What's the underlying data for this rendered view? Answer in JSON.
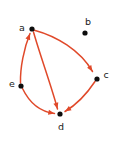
{
  "figure": {
    "background_color": "#ffffff",
    "width": 114,
    "height": 145
  },
  "style": {
    "edge_color": "#e0492a",
    "node_color": "#0d0d0d",
    "label_color": "#1a1a1a",
    "node_radius": 2.6,
    "edge_width": 1.5
  },
  "chart_data": {
    "type": "diagram",
    "diagram_type": "directed-graph",
    "title": "",
    "directed": true,
    "nodes": [
      {
        "id": "a",
        "label": "a",
        "x": 32,
        "y": 29,
        "label_x": 22,
        "label_y": 28,
        "label_anchor": "middle"
      },
      {
        "id": "b",
        "label": "b",
        "x": 85,
        "y": 33,
        "label_x": 88,
        "label_y": 22,
        "label_anchor": "middle"
      },
      {
        "id": "c",
        "label": "c",
        "x": 97,
        "y": 79,
        "label_x": 106,
        "label_y": 75,
        "label_anchor": "middle"
      },
      {
        "id": "d",
        "label": "d",
        "x": 60,
        "y": 114,
        "label_x": 61,
        "label_y": 127,
        "label_anchor": "middle"
      },
      {
        "id": "e",
        "label": "e",
        "x": 21,
        "y": 86,
        "label_x": 12,
        "label_y": 84,
        "label_anchor": "middle"
      }
    ],
    "edges": [
      {
        "id": "a-c",
        "from": "a",
        "to": "c",
        "curve": "convex-up",
        "path": "M 34.4 30.2 C 56 36 80 50 92.5 71.5"
      },
      {
        "id": "a-d",
        "from": "a",
        "to": "d",
        "curve": "convex-left",
        "path": "M 33.5 32 C 40 55 52 88 57.5 109"
      },
      {
        "id": "e-a",
        "from": "e",
        "to": "a",
        "curve": "convex-left",
        "path": "M 20.5 83 C 20 68 24 48 30 33.5"
      },
      {
        "id": "e-d",
        "from": "e",
        "to": "d",
        "curve": "convex-down",
        "path": "M 22.5 88.5 C 30 104 42 112 54.5 113.5"
      },
      {
        "id": "c-d",
        "from": "c",
        "to": "d",
        "curve": "convex-up",
        "path": "M 95 81.5 C 86 95 76 105 65 111.5"
      }
    ],
    "isolated_nodes": [
      "b"
    ],
    "adjacency": {
      "a": [
        "c",
        "d"
      ],
      "b": [],
      "c": [
        "d"
      ],
      "d": [],
      "e": [
        "a",
        "d"
      ]
    },
    "edge_count": 5,
    "node_count": 5
  }
}
